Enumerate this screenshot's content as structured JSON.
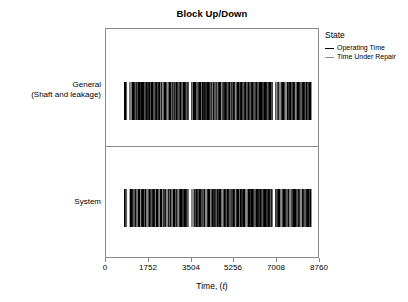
{
  "chart_data": {
    "type": "bar",
    "title": "Block Up/Down",
    "xlabel": "Time, (t)",
    "ylabel": "",
    "xlim": [
      0,
      8760
    ],
    "xticks": [
      0,
      1752,
      3504,
      5256,
      7008,
      8760
    ],
    "xticklabels": [
      "0",
      "1752",
      "3504",
      "5256",
      "7008",
      "8760"
    ],
    "grid": false,
    "legend_position": "right",
    "legend_title": "State",
    "series": [
      {
        "name": "Operating Time",
        "color": "#000000"
      },
      {
        "name": "Time Under Repair",
        "color": "#8c8c8c"
      }
    ],
    "categories": [
      "General (Shaft and leakage)",
      "System"
    ],
    "panels": [
      {
        "label_line1": "General",
        "label_line2": "(Shaft and leakage)",
        "data_start": 780,
        "data_end": 8450,
        "description": "Dense alternating operating / repair intervals rendered as vertical bars across the block up/down timeline"
      },
      {
        "label_line1": "System",
        "label_line2": "",
        "data_start": 780,
        "data_end": 8450,
        "description": "Dense alternating operating / repair intervals rendered as vertical bars across the block up/down timeline"
      }
    ]
  },
  "chart": {
    "title": "Block Up/Down",
    "xaxis_title_main": "Time, (",
    "xaxis_title_italic": "t",
    "xaxis_title_end": ")",
    "ticks": [
      {
        "value": 0,
        "label": "0"
      },
      {
        "value": 1752,
        "label": "1752"
      },
      {
        "value": 3504,
        "label": "3504"
      },
      {
        "value": 5256,
        "label": "5256"
      },
      {
        "value": 7008,
        "label": "7008"
      },
      {
        "value": 8760,
        "label": "8760"
      }
    ],
    "panels": {
      "general": {
        "line1": "General",
        "line2": "(Shaft and leakage)"
      },
      "system": {
        "line1": "System",
        "line2": ""
      }
    },
    "legend": {
      "title": "State",
      "items": [
        {
          "label": "Operating Time",
          "color": "#000000"
        },
        {
          "label": "Time Under Repair",
          "color": "#8c8c8c"
        }
      ]
    }
  }
}
